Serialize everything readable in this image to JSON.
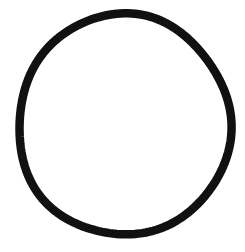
{
  "image": {
    "width": 245,
    "height": 252,
    "background_color": "#ffffff"
  },
  "shape": {
    "type": "circle-outline",
    "style": "hand-drawn",
    "stroke_color": "#111111",
    "fill": "none",
    "center_x": 124,
    "center_y": 125,
    "radius_x": 106,
    "radius_y": 110.5,
    "stroke_width": 8.5
  }
}
